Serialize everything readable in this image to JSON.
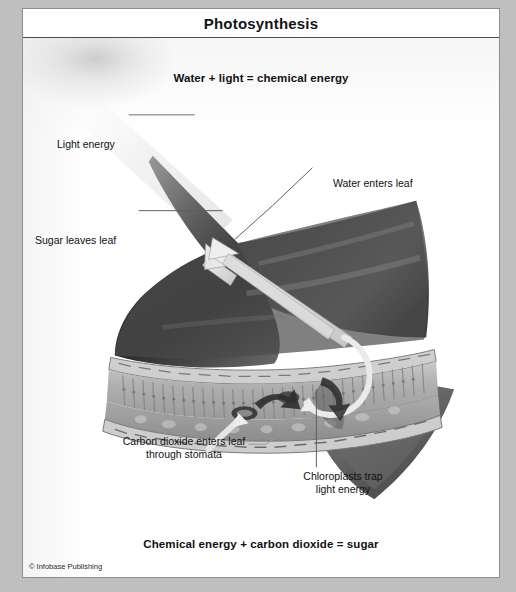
{
  "figure": {
    "title": "Photosynthesis",
    "equation_top": "Water + light = chemical energy",
    "equation_bottom": "Chemical energy + carbon dioxide = sugar",
    "copyright": "© Infobase Publishing",
    "style": "grayscale-airbrush-illustration"
  },
  "labels": {
    "light_energy": "Light energy",
    "water_enters": "Water enters leaf",
    "sugar_leaves": "Sugar leaves leaf",
    "carbon_dioxide": "Carbon dioxide enters leaf\nthrough stomata",
    "chloroplasts": "Chloroplasts trap\nlight energy"
  },
  "colors": {
    "frame": "#bfbfbf",
    "panel": "#ffffff",
    "rule": "#4a4a4a",
    "text": "#111111",
    "leader_line": "#6a6a6a",
    "leaf_dark": "#3a3a3a",
    "leaf_mid": "#6e6e6e",
    "leaf_light": "#b9b9b9",
    "arrow_light": "#e3e3e3",
    "cell_wall": "#8a8a8a"
  },
  "structures": {
    "upper_epidermis": "upper-epidermis",
    "palisade_layer": "palisade-mesophyll-cells",
    "spongy_layer": "spongy-mesophyll",
    "lower_epidermis": "lower-epidermis",
    "stoma": "stoma-opening",
    "vein": "leaf-vein",
    "blade_tip": "leaf-blade-tip"
  }
}
